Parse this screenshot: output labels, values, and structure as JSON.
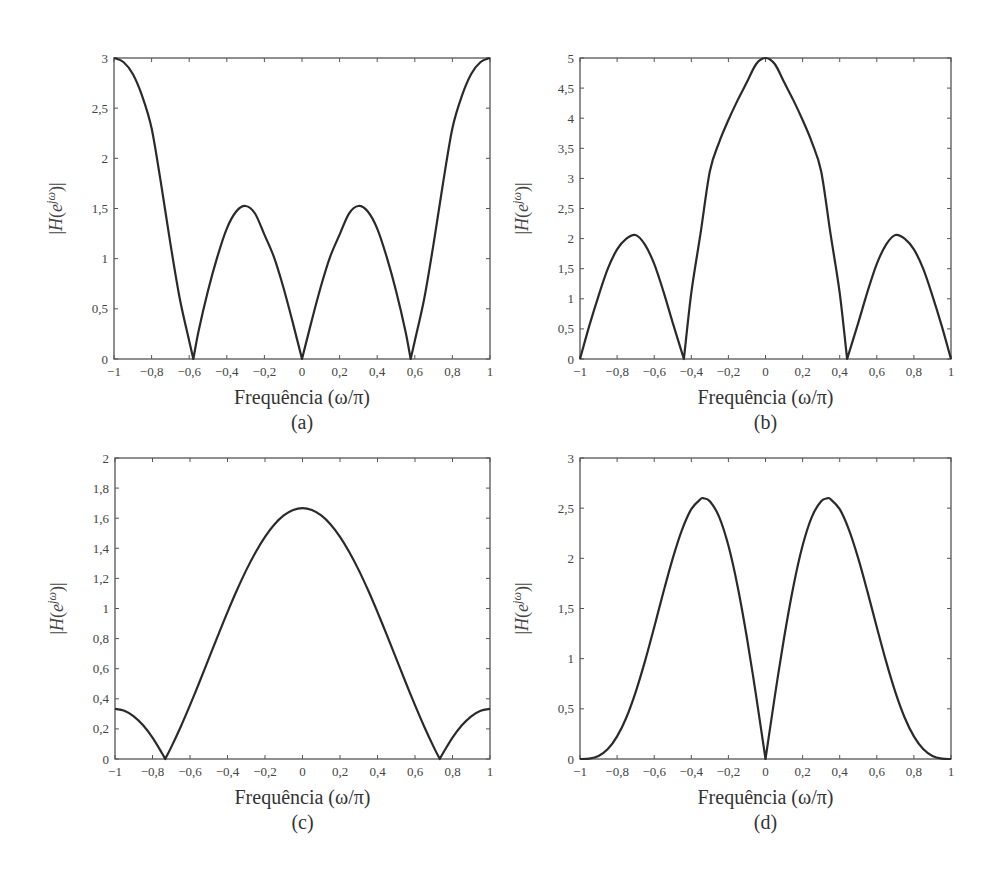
{
  "figure": {
    "panels": [
      "(a)",
      "(b)",
      "(c)",
      "(d)"
    ],
    "xlabel": "Frequência (ω/π)",
    "ylabel": "|H(e^{jω})|",
    "ylabel_base": "|H(e",
    "ylabel_sup": "jω",
    "ylabel_tail": ")|"
  },
  "chart_data": [
    {
      "type": "line",
      "panel": "(a)",
      "title": "",
      "xlabel": "Frequência (ω/π)",
      "ylabel": "|H(e^{jω})|",
      "xlim": [
        -1,
        1
      ],
      "ylim": [
        0,
        3
      ],
      "grid": false,
      "x_ticks": [
        -1,
        -0.8,
        -0.6,
        -0.4,
        -0.2,
        0,
        0.2,
        0.4,
        0.6,
        0.8,
        1
      ],
      "x_tick_labels": [
        "−1",
        "−0,8",
        "−0,6",
        "−0,4",
        "−0,2",
        "0",
        "0,2",
        "0,4",
        "0,6",
        "0,8",
        "1"
      ],
      "y_ticks": [
        0,
        0.5,
        1,
        1.5,
        2,
        2.5,
        3
      ],
      "y_tick_labels": [
        "0",
        "0,5",
        "1",
        "1,5",
        "2",
        "2,5",
        "3"
      ],
      "box": {
        "left": 114,
        "top": 58,
        "right": 490,
        "bottom": 359
      },
      "x": [
        -1,
        -0.95,
        -0.9,
        -0.85,
        -0.8,
        -0.75,
        -0.7,
        -0.65,
        -0.6,
        -0.578,
        -0.55,
        -0.5,
        -0.45,
        -0.4,
        -0.35,
        -0.3,
        -0.25,
        -0.2,
        -0.15,
        -0.1,
        -0.05,
        0,
        0.05,
        0.1,
        0.15,
        0.2,
        0.25,
        0.3,
        0.35,
        0.4,
        0.45,
        0.5,
        0.55,
        0.578,
        0.6,
        0.65,
        0.7,
        0.75,
        0.8,
        0.85,
        0.9,
        0.95,
        1
      ],
      "y": [
        3,
        2.96,
        2.84,
        2.62,
        2.3,
        1.75,
        1.15,
        0.6,
        0.18,
        0,
        0.28,
        0.68,
        1.02,
        1.3,
        1.47,
        1.525,
        1.45,
        1.24,
        1.02,
        0.72,
        0.37,
        0,
        0.37,
        0.72,
        1.02,
        1.24,
        1.45,
        1.525,
        1.47,
        1.3,
        1.02,
        0.68,
        0.28,
        0,
        0.18,
        0.6,
        1.15,
        1.75,
        2.3,
        2.62,
        2.84,
        2.96,
        3
      ]
    },
    {
      "type": "line",
      "panel": "(b)",
      "title": "",
      "xlabel": "Frequência (ω/π)",
      "ylabel": "|H(e^{jω})|",
      "xlim": [
        -1,
        1
      ],
      "ylim": [
        0,
        5
      ],
      "grid": false,
      "x_ticks": [
        -1,
        -0.8,
        -0.6,
        -0.4,
        -0.2,
        0,
        0.2,
        0.4,
        0.6,
        0.8,
        1
      ],
      "x_tick_labels": [
        "−1",
        "−0,8",
        "−0,6",
        "−0,4",
        "−0,2",
        "0",
        "0,2",
        "0,4",
        "0,6",
        "0,8",
        "1"
      ],
      "y_ticks": [
        0,
        0.5,
        1,
        1.5,
        2,
        2.5,
        3,
        3.5,
        4,
        4.5,
        5
      ],
      "y_tick_labels": [
        "0",
        "0,5",
        "1",
        "1,5",
        "2",
        "2,5",
        "3",
        "3,5",
        "4",
        "4,5",
        "5"
      ],
      "box": {
        "left": 580,
        "top": 58,
        "right": 951,
        "bottom": 359
      },
      "x": [
        -1,
        -0.95,
        -0.9,
        -0.85,
        -0.8,
        -0.75,
        -0.7,
        -0.65,
        -0.6,
        -0.55,
        -0.5,
        -0.44,
        -0.4,
        -0.35,
        -0.3,
        -0.25,
        -0.2,
        -0.15,
        -0.1,
        -0.05,
        0,
        0.05,
        0.1,
        0.15,
        0.2,
        0.25,
        0.3,
        0.35,
        0.4,
        0.44,
        0.5,
        0.55,
        0.6,
        0.65,
        0.7,
        0.75,
        0.8,
        0.85,
        0.9,
        0.95,
        1
      ],
      "y": [
        0,
        0.55,
        1.05,
        1.5,
        1.82,
        2.0,
        2.06,
        1.9,
        1.58,
        1.12,
        0.6,
        0,
        1.1,
        2.09,
        3.12,
        3.6,
        3.97,
        4.3,
        4.6,
        4.9,
        5,
        4.9,
        4.6,
        4.3,
        3.97,
        3.6,
        3.12,
        2.09,
        1.1,
        0,
        0.6,
        1.12,
        1.58,
        1.9,
        2.06,
        2.0,
        1.82,
        1.5,
        1.05,
        0.55,
        0
      ]
    },
    {
      "type": "line",
      "panel": "(c)",
      "title": "",
      "xlabel": "Frequência (ω/π)",
      "ylabel": "|H(e^{jω})|",
      "xlim": [
        -1,
        1
      ],
      "ylim": [
        0,
        2
      ],
      "grid": false,
      "x_ticks": [
        -1,
        -0.8,
        -0.6,
        -0.4,
        -0.2,
        0,
        0.2,
        0.4,
        0.6,
        0.8,
        1
      ],
      "x_tick_labels": [
        "−1",
        "−0,8",
        "−0,6",
        "−0,4",
        "−0,2",
        "0",
        "0,2",
        "0,4",
        "0,6",
        "0,8",
        "1"
      ],
      "y_ticks": [
        0,
        0.2,
        0.4,
        0.6,
        0.8,
        1,
        1.2,
        1.4,
        1.6,
        1.8,
        2
      ],
      "y_tick_labels": [
        "0",
        "0,2",
        "0,4",
        "0,6",
        "0,8",
        "1",
        "1,2",
        "1,4",
        "1,6",
        "1,8",
        "2"
      ],
      "box": {
        "left": 115,
        "top": 458,
        "right": 490,
        "bottom": 759
      },
      "x": [
        -1,
        -0.95,
        -0.9,
        -0.85,
        -0.8,
        -0.75,
        -0.732,
        -0.7,
        -0.65,
        -0.6,
        -0.55,
        -0.5,
        -0.45,
        -0.4,
        -0.35,
        -0.3,
        -0.25,
        -0.2,
        -0.15,
        -0.1,
        -0.05,
        0,
        0.05,
        0.1,
        0.15,
        0.2,
        0.25,
        0.3,
        0.35,
        0.4,
        0.45,
        0.5,
        0.55,
        0.6,
        0.65,
        0.7,
        0.732,
        0.75,
        0.8,
        0.85,
        0.9,
        0.95,
        1
      ],
      "y": [
        0.333,
        0.321,
        0.284,
        0.224,
        0.142,
        0.04,
        0,
        0.079,
        0.213,
        0.358,
        0.51,
        0.667,
        0.823,
        0.976,
        1.121,
        1.255,
        1.374,
        1.476,
        1.558,
        1.618,
        1.654,
        1.667,
        1.654,
        1.618,
        1.558,
        1.476,
        1.374,
        1.255,
        1.121,
        0.976,
        0.823,
        0.667,
        0.51,
        0.358,
        0.213,
        0.079,
        0,
        0.04,
        0.142,
        0.224,
        0.284,
        0.321,
        0.333
      ]
    },
    {
      "type": "line",
      "panel": "(d)",
      "title": "",
      "xlabel": "Frequência (ω/π)",
      "ylabel": "|H(e^{jω})|",
      "xlim": [
        -1,
        1
      ],
      "ylim": [
        0,
        3
      ],
      "grid": false,
      "x_ticks": [
        -1,
        -0.8,
        -0.6,
        -0.4,
        -0.2,
        0,
        0.2,
        0.4,
        0.6,
        0.8,
        1
      ],
      "x_tick_labels": [
        "−1",
        "−0,8",
        "−0,6",
        "−0,4",
        "−0,2",
        "0",
        "0,2",
        "0,4",
        "0,6",
        "0,8",
        "1"
      ],
      "y_ticks": [
        0,
        0.5,
        1,
        1.5,
        2,
        2.5,
        3
      ],
      "y_tick_labels": [
        "0",
        "0,5",
        "1",
        "1,5",
        "2",
        "2,5",
        "3"
      ],
      "box": {
        "left": 580,
        "top": 458,
        "right": 951,
        "bottom": 759
      },
      "x": [
        -1,
        -0.95,
        -0.9,
        -0.85,
        -0.8,
        -0.75,
        -0.7,
        -0.65,
        -0.6,
        -0.55,
        -0.5,
        -0.45,
        -0.4,
        -0.35,
        -0.333,
        -0.3,
        -0.25,
        -0.2,
        -0.15,
        -0.1,
        -0.05,
        0,
        0.05,
        0.1,
        0.15,
        0.2,
        0.25,
        0.3,
        0.333,
        0.35,
        0.4,
        0.45,
        0.5,
        0.55,
        0.6,
        0.65,
        0.7,
        0.75,
        0.8,
        0.85,
        0.9,
        0.95,
        1
      ],
      "y": [
        0,
        0.004,
        0.03,
        0.099,
        0.225,
        0.414,
        0.667,
        0.973,
        1.314,
        1.666,
        2.0,
        2.284,
        2.49,
        2.591,
        2.598,
        2.569,
        2.414,
        2.127,
        1.717,
        1.206,
        0.622,
        0,
        0.622,
        1.206,
        1.717,
        2.127,
        2.414,
        2.569,
        2.598,
        2.591,
        2.49,
        2.284,
        2.0,
        1.666,
        1.314,
        0.973,
        0.667,
        0.414,
        0.225,
        0.099,
        0.03,
        0.004,
        0
      ]
    }
  ]
}
